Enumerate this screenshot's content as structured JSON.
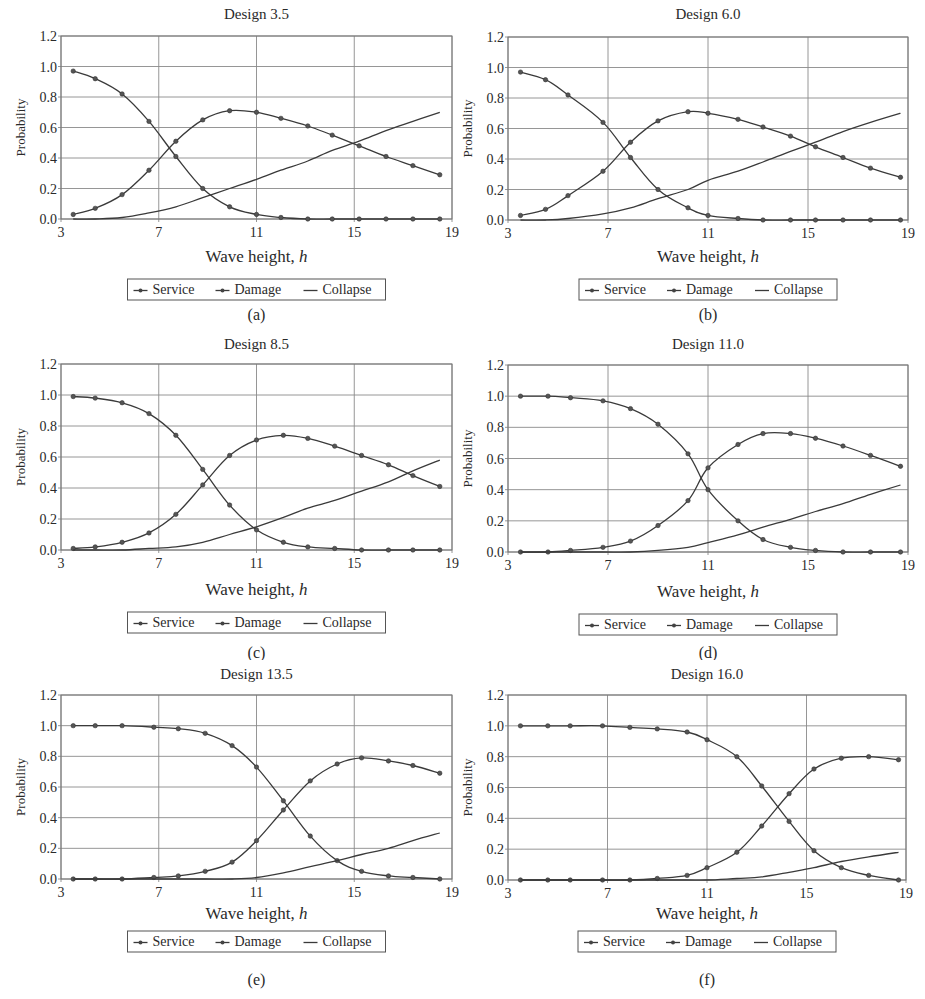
{
  "figure": {
    "panels_layout": "3 rows x 2 columns"
  },
  "chart_data": [
    {
      "id": "a",
      "type": "line",
      "title": "Design 3.5",
      "caption": "(a)",
      "xlabel": "Wave height, h",
      "ylabel": "Probability",
      "xlim": [
        3,
        19
      ],
      "ylim": [
        0,
        1.2
      ],
      "xticks": [
        3,
        7,
        11,
        15,
        19
      ],
      "yticks": [
        "0.0",
        "0.2",
        "0.4",
        "0.6",
        "0.8",
        "1.0",
        "1.2"
      ],
      "grid": true,
      "legend": [
        "Service",
        "Damage",
        "Collapse"
      ],
      "legend_position": "bottom",
      "x": [
        3.5,
        4.4,
        5.5,
        6.6,
        7.7,
        8.8,
        9.9,
        11.0,
        12.0,
        13.1,
        14.1,
        15.2,
        16.3,
        17.4,
        18.5
      ],
      "series": [
        {
          "name": "Service",
          "marker": true,
          "values": [
            0.97,
            0.92,
            0.82,
            0.64,
            0.41,
            0.2,
            0.08,
            0.03,
            0.01,
            0.0,
            0.0,
            0.0,
            0.0,
            0.0,
            0.0
          ]
        },
        {
          "name": "Damage",
          "marker": true,
          "values": [
            0.03,
            0.07,
            0.16,
            0.32,
            0.51,
            0.65,
            0.71,
            0.7,
            0.66,
            0.61,
            0.55,
            0.48,
            0.41,
            0.35,
            0.29
          ]
        },
        {
          "name": "Collapse",
          "marker": false,
          "values": [
            0.0,
            0.0,
            0.01,
            0.04,
            0.08,
            0.14,
            0.2,
            0.26,
            0.32,
            0.38,
            0.45,
            0.51,
            0.58,
            0.64,
            0.7
          ]
        }
      ]
    },
    {
      "id": "b",
      "type": "line",
      "title": "Design 6.0",
      "caption": "(b)",
      "xlabel": "Wave height, h",
      "ylabel": "Probability",
      "xlim": [
        3,
        19
      ],
      "ylim": [
        0,
        1.2
      ],
      "xticks": [
        3,
        7,
        11,
        15,
        19
      ],
      "yticks": [
        "0.0",
        "0.2",
        "0.4",
        "0.6",
        "0.8",
        "1.0",
        "1.2"
      ],
      "grid": true,
      "legend": [
        "Service",
        "Damage",
        "Collapse"
      ],
      "legend_position": "bottom",
      "x": [
        3.5,
        4.5,
        5.4,
        6.8,
        7.9,
        9.0,
        10.2,
        11.0,
        12.2,
        13.2,
        14.3,
        15.3,
        16.4,
        17.5,
        18.7
      ],
      "series": [
        {
          "name": "Service",
          "marker": true,
          "values": [
            0.97,
            0.92,
            0.82,
            0.64,
            0.41,
            0.2,
            0.08,
            0.03,
            0.01,
            0.0,
            0.0,
            0.0,
            0.0,
            0.0,
            0.0
          ]
        },
        {
          "name": "Damage",
          "marker": true,
          "values": [
            0.03,
            0.07,
            0.16,
            0.32,
            0.51,
            0.65,
            0.71,
            0.7,
            0.66,
            0.61,
            0.55,
            0.48,
            0.41,
            0.34,
            0.28
          ]
        },
        {
          "name": "Collapse",
          "marker": false,
          "values": [
            0.0,
            0.0,
            0.01,
            0.04,
            0.08,
            0.14,
            0.2,
            0.26,
            0.32,
            0.38,
            0.45,
            0.51,
            0.58,
            0.64,
            0.7
          ]
        }
      ]
    },
    {
      "id": "c",
      "type": "line",
      "title": "Design 8.5",
      "caption": "(c)",
      "xlabel": "Wave height, h",
      "ylabel": "Probability",
      "xlim": [
        3,
        19
      ],
      "ylim": [
        0,
        1.2
      ],
      "xticks": [
        3,
        7,
        11,
        15,
        19
      ],
      "yticks": [
        "0.0",
        "0.2",
        "0.4",
        "0.6",
        "0.8",
        "1.0",
        "1.2"
      ],
      "grid": true,
      "legend": [
        "Service",
        "Damage",
        "Collapse"
      ],
      "legend_position": "bottom",
      "x": [
        3.5,
        4.4,
        5.5,
        6.6,
        7.7,
        8.8,
        9.9,
        11.0,
        12.1,
        13.1,
        14.2,
        15.3,
        16.4,
        17.4,
        18.5
      ],
      "series": [
        {
          "name": "Service",
          "marker": true,
          "values": [
            0.99,
            0.98,
            0.95,
            0.88,
            0.74,
            0.52,
            0.29,
            0.13,
            0.05,
            0.02,
            0.01,
            0.0,
            0.0,
            0.0,
            0.0
          ]
        },
        {
          "name": "Damage",
          "marker": true,
          "values": [
            0.01,
            0.02,
            0.05,
            0.11,
            0.23,
            0.42,
            0.61,
            0.71,
            0.74,
            0.72,
            0.67,
            0.61,
            0.55,
            0.48,
            0.41
          ]
        },
        {
          "name": "Collapse",
          "marker": false,
          "values": [
            0.0,
            0.0,
            0.0,
            0.01,
            0.02,
            0.05,
            0.1,
            0.15,
            0.21,
            0.27,
            0.32,
            0.38,
            0.44,
            0.51,
            0.58
          ]
        }
      ]
    },
    {
      "id": "d",
      "type": "line",
      "title": "Design 11.0",
      "caption": "(d)",
      "xlabel": "Wave height, h",
      "ylabel": "Probability",
      "xlim": [
        3,
        19
      ],
      "ylim": [
        0,
        1.2
      ],
      "xticks": [
        3,
        7,
        11,
        15,
        19
      ],
      "yticks": [
        "0.0",
        "0.2",
        "0.4",
        "0.6",
        "0.8",
        "1.0",
        "1.2"
      ],
      "grid": true,
      "legend": [
        "Service",
        "Damage",
        "Collapse"
      ],
      "legend_position": "bottom",
      "x": [
        3.5,
        4.6,
        5.5,
        6.8,
        7.9,
        9.0,
        10.2,
        11.0,
        12.2,
        13.2,
        14.3,
        15.3,
        16.4,
        17.5,
        18.7
      ],
      "series": [
        {
          "name": "Service",
          "marker": true,
          "values": [
            1.0,
            1.0,
            0.99,
            0.97,
            0.92,
            0.82,
            0.63,
            0.4,
            0.2,
            0.08,
            0.03,
            0.01,
            0.0,
            0.0,
            0.0
          ]
        },
        {
          "name": "Damage",
          "marker": true,
          "values": [
            0.0,
            0.0,
            0.01,
            0.03,
            0.07,
            0.17,
            0.33,
            0.54,
            0.69,
            0.76,
            0.76,
            0.73,
            0.68,
            0.62,
            0.55
          ]
        },
        {
          "name": "Collapse",
          "marker": false,
          "values": [
            0.0,
            0.0,
            0.0,
            0.0,
            0.0,
            0.01,
            0.03,
            0.06,
            0.11,
            0.16,
            0.21,
            0.26,
            0.31,
            0.37,
            0.43
          ]
        }
      ]
    },
    {
      "id": "e",
      "type": "line",
      "title": "Design 13.5",
      "caption": "(e)",
      "xlabel": "Wave height, h",
      "ylabel": "Probability",
      "xlim": [
        3,
        19
      ],
      "ylim": [
        0,
        1.2
      ],
      "xticks": [
        3,
        7,
        11,
        15,
        19
      ],
      "yticks": [
        "0.0",
        "0.2",
        "0.4",
        "0.6",
        "0.8",
        "1.0",
        "1.2"
      ],
      "grid": true,
      "legend": [
        "Service",
        "Damage",
        "Collapse"
      ],
      "legend_position": "bottom",
      "x": [
        3.5,
        4.4,
        5.5,
        6.8,
        7.8,
        8.9,
        10.0,
        11.0,
        12.1,
        13.2,
        14.3,
        15.3,
        16.4,
        17.4,
        18.5
      ],
      "series": [
        {
          "name": "Service",
          "marker": true,
          "values": [
            1.0,
            1.0,
            1.0,
            0.99,
            0.98,
            0.95,
            0.87,
            0.73,
            0.51,
            0.28,
            0.12,
            0.05,
            0.02,
            0.01,
            0.0
          ]
        },
        {
          "name": "Damage",
          "marker": true,
          "values": [
            0.0,
            0.0,
            0.0,
            0.01,
            0.02,
            0.05,
            0.11,
            0.25,
            0.45,
            0.64,
            0.75,
            0.79,
            0.77,
            0.74,
            0.69
          ]
        },
        {
          "name": "Collapse",
          "marker": false,
          "values": [
            0.0,
            0.0,
            0.0,
            0.0,
            0.0,
            0.0,
            0.0,
            0.01,
            0.04,
            0.08,
            0.12,
            0.16,
            0.2,
            0.25,
            0.3
          ]
        }
      ]
    },
    {
      "id": "f",
      "type": "line",
      "title": "Design 16.0",
      "caption": "(f)",
      "xlabel": "Wave height, h",
      "ylabel": "Probability",
      "xlim": [
        3,
        19
      ],
      "ylim": [
        0,
        1.2
      ],
      "xticks": [
        3,
        7,
        11,
        15,
        19
      ],
      "yticks": [
        "0.0",
        "0.2",
        "0.4",
        "0.6",
        "0.8",
        "1.0",
        "1.2"
      ],
      "grid": true,
      "legend": [
        "Service",
        "Damage",
        "Collapse"
      ],
      "legend_position": "bottom",
      "x": [
        3.5,
        4.6,
        5.5,
        6.8,
        7.9,
        9.0,
        10.2,
        11.0,
        12.2,
        13.2,
        14.3,
        15.3,
        16.4,
        17.5,
        18.7
      ],
      "series": [
        {
          "name": "Service",
          "marker": true,
          "values": [
            1.0,
            1.0,
            1.0,
            1.0,
            0.99,
            0.98,
            0.96,
            0.91,
            0.8,
            0.61,
            0.38,
            0.19,
            0.08,
            0.03,
            0.0
          ]
        },
        {
          "name": "Damage",
          "marker": true,
          "values": [
            0.0,
            0.0,
            0.0,
            0.0,
            0.0,
            0.01,
            0.03,
            0.08,
            0.18,
            0.35,
            0.56,
            0.72,
            0.79,
            0.8,
            0.78
          ]
        },
        {
          "name": "Collapse",
          "marker": false,
          "values": [
            0.0,
            0.0,
            0.0,
            0.0,
            0.0,
            0.0,
            0.0,
            0.0,
            0.01,
            0.02,
            0.05,
            0.08,
            0.12,
            0.15,
            0.18
          ]
        }
      ]
    }
  ],
  "style": {
    "line_color": "#3a3a3a",
    "grid_color": "#8a8a8a",
    "frame_color": "#777777",
    "background": "#ffffff"
  }
}
